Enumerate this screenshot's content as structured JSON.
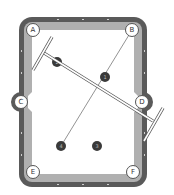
{
  "diagram": {
    "type": "pool-table-shot-diagram",
    "colors": {
      "rail": "#5a5a5a",
      "cushion": "#b0b0b0",
      "felt": "#ffffff",
      "ball": "#3a3a3a",
      "line": "#777777"
    },
    "pockets": [
      {
        "id": "A",
        "label": "A",
        "x": 33,
        "y": 30
      },
      {
        "id": "B",
        "label": "B",
        "x": 132,
        "y": 30
      },
      {
        "id": "C",
        "label": "C",
        "x": 21,
        "y": 102
      },
      {
        "id": "D",
        "label": "D",
        "x": 142,
        "y": 102
      },
      {
        "id": "E",
        "label": "E",
        "x": 33,
        "y": 172
      },
      {
        "id": "F",
        "label": "F",
        "x": 133,
        "y": 172
      }
    ],
    "balls": [
      {
        "id": "ball-2",
        "label": "2",
        "x": 57,
        "y": 62
      },
      {
        "id": "ball-1",
        "label": "1",
        "x": 105,
        "y": 77
      },
      {
        "id": "ball-4",
        "label": "4",
        "x": 61,
        "y": 146
      },
      {
        "id": "ball-3",
        "label": "3",
        "x": 97,
        "y": 146
      }
    ],
    "aim_line": {
      "from": "B",
      "to": "ball-4"
    },
    "bridge": {
      "label": "cue bridge / straightedge"
    }
  }
}
